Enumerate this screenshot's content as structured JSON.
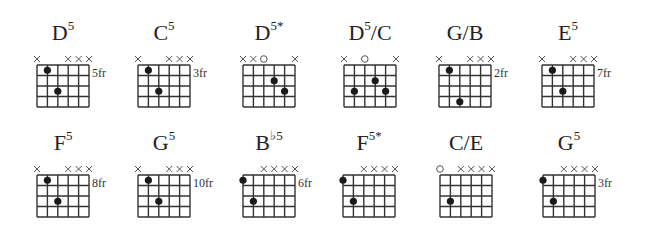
{
  "page": {
    "background": "#ffffff",
    "line_color": "#333333",
    "dot_color": "#1a1a1a"
  },
  "chords": [
    {
      "name": "D",
      "sup": "5",
      "suffix": "",
      "fret_label": "5fr",
      "strings": [
        "x",
        "",
        "",
        "x",
        "x",
        "x"
      ],
      "dots": [
        {
          "string": 2,
          "fret": 1
        },
        {
          "string": 3,
          "fret": 3
        }
      ],
      "pos": {
        "left": 37,
        "top": 21
      }
    },
    {
      "name": "C",
      "sup": "5",
      "suffix": "",
      "fret_label": "3fr",
      "strings": [
        "x",
        "",
        "",
        "x",
        "x",
        "x"
      ],
      "dots": [
        {
          "string": 2,
          "fret": 1
        },
        {
          "string": 3,
          "fret": 3
        }
      ],
      "pos": {
        "left": 138,
        "top": 21
      }
    },
    {
      "name": "D",
      "sup": "5*",
      "suffix": "",
      "fret_label": "",
      "strings": [
        "x",
        "x",
        "o",
        "",
        "",
        "x"
      ],
      "dots": [
        {
          "string": 4,
          "fret": 2
        },
        {
          "string": 5,
          "fret": 3
        }
      ],
      "pos": {
        "left": 243,
        "top": 21
      }
    },
    {
      "name": "D",
      "sup": "5",
      "suffix": "/C",
      "fret_label": "",
      "strings": [
        "x",
        "",
        "o",
        "",
        "",
        "x"
      ],
      "dots": [
        {
          "string": 2,
          "fret": 3
        },
        {
          "string": 4,
          "fret": 2
        },
        {
          "string": 5,
          "fret": 3
        }
      ],
      "pos": {
        "left": 344,
        "top": 21
      }
    },
    {
      "name": "G/B",
      "sup": "",
      "suffix": "",
      "fret_label": "2fr",
      "strings": [
        "x",
        "",
        "",
        "x",
        "x",
        "x"
      ],
      "dots": [
        {
          "string": 2,
          "fret": 1
        },
        {
          "string": 3,
          "fret": 4
        }
      ],
      "pos": {
        "left": 439,
        "top": 21
      }
    },
    {
      "name": "E",
      "sup": "5",
      "suffix": "",
      "fret_label": "7fr",
      "strings": [
        "x",
        "",
        "",
        "x",
        "x",
        "x"
      ],
      "dots": [
        {
          "string": 2,
          "fret": 1
        },
        {
          "string": 3,
          "fret": 3
        }
      ],
      "pos": {
        "left": 542,
        "top": 21
      }
    },
    {
      "name": "F",
      "sup": "5",
      "suffix": "",
      "fret_label": "8fr",
      "strings": [
        "x",
        "",
        "",
        "x",
        "x",
        "x"
      ],
      "dots": [
        {
          "string": 2,
          "fret": 1
        },
        {
          "string": 3,
          "fret": 3
        }
      ],
      "pos": {
        "left": 37,
        "top": 131
      }
    },
    {
      "name": "G",
      "sup": "5",
      "suffix": "",
      "fret_label": "10fr",
      "strings": [
        "x",
        "",
        "",
        "x",
        "x",
        "x"
      ],
      "dots": [
        {
          "string": 2,
          "fret": 1
        },
        {
          "string": 3,
          "fret": 3
        }
      ],
      "pos": {
        "left": 138,
        "top": 131
      }
    },
    {
      "name": "B",
      "sup": "♭5",
      "suffix": "",
      "fret_label": "6fr",
      "strings": [
        "",
        "",
        "x",
        "x",
        "x",
        "x"
      ],
      "dots": [
        {
          "string": 1,
          "fret": 1
        },
        {
          "string": 2,
          "fret": 3
        }
      ],
      "pos": {
        "left": 243,
        "top": 131
      }
    },
    {
      "name": "F",
      "sup": "5*",
      "suffix": "",
      "fret_label": "",
      "strings": [
        "",
        "",
        "x",
        "x",
        "x",
        "x"
      ],
      "dots": [
        {
          "string": 1,
          "fret": 1
        },
        {
          "string": 2,
          "fret": 3
        }
      ],
      "pos": {
        "left": 343,
        "top": 131
      }
    },
    {
      "name": "C/E",
      "sup": "",
      "suffix": "",
      "fret_label": "",
      "strings": [
        "o",
        "",
        "x",
        "x",
        "x",
        "x"
      ],
      "dots": [
        {
          "string": 2,
          "fret": 3
        }
      ],
      "pos": {
        "left": 440,
        "top": 131
      }
    },
    {
      "name": "G",
      "sup": "5",
      "suffix": "",
      "fret_label": "3fr",
      "strings": [
        "",
        "",
        "x",
        "x",
        "x",
        "x"
      ],
      "dots": [
        {
          "string": 1,
          "fret": 1
        },
        {
          "string": 2,
          "fret": 3
        }
      ],
      "pos": {
        "left": 543,
        "top": 131
      }
    }
  ]
}
